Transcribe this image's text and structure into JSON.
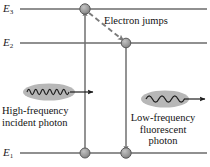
{
  "diagram": {
    "type": "energy-level-diagram",
    "width": 210,
    "height": 167,
    "background_color": "#ffffff",
    "line_color": "#6b6b6b",
    "dot_fill_color": "#9a9a9a",
    "dot_stroke_color": "#4a4a4a",
    "ellipse_fill_color": "#b5b5b5",
    "wave_color": "#2a2a2a",
    "arrow_color": "#6f6f6f",
    "dashed_arrow_color": "#7a7a7a"
  },
  "levels": [
    {
      "id": "E3",
      "label": "E",
      "subscript": "3",
      "y": 9,
      "x_start": 20,
      "x_end": 207
    },
    {
      "id": "E2",
      "label": "E",
      "subscript": "2",
      "y": 43,
      "x_start": 20,
      "x_end": 207
    },
    {
      "id": "E1",
      "label": "E",
      "subscript": "1",
      "y": 153,
      "x_start": 20,
      "x_end": 207
    }
  ],
  "electron_dots": [
    {
      "name": "dot-e3",
      "x": 85,
      "y": 9
    },
    {
      "name": "dot-e2",
      "x": 126,
      "y": 43
    },
    {
      "name": "dot-e1-left",
      "x": 85,
      "y": 153
    },
    {
      "name": "dot-e1-right",
      "x": 126,
      "y": 153
    }
  ],
  "transitions": [
    {
      "name": "absorption-arrow",
      "style": "solid",
      "direction": "up",
      "from": {
        "x": 85,
        "y": 153
      },
      "to": {
        "x": 85,
        "y": 9
      }
    },
    {
      "name": "nonradiative-arrow",
      "style": "dashed",
      "direction": "down-right",
      "from": {
        "x": 89,
        "y": 13
      },
      "to": {
        "x": 124,
        "y": 41
      }
    },
    {
      "name": "emission-arrow",
      "style": "solid",
      "direction": "down",
      "from": {
        "x": 126,
        "y": 43
      },
      "to": {
        "x": 126,
        "y": 153
      }
    }
  ],
  "annotations": {
    "electron_jumps": "Electron jumps"
  },
  "photons": [
    {
      "id": "incident",
      "name": "high-frequency-incident-photon",
      "ellipse": {
        "cx": 49,
        "cy": 92,
        "rx": 26,
        "ry": 8.5
      },
      "wave": {
        "cycles": 6,
        "amplitude": 5,
        "x_start": 27,
        "x_end": 69
      },
      "arrow": {
        "x_start": 70,
        "x_end": 95,
        "y": 92
      },
      "caption_lines": [
        "High-frequency",
        "incident photon"
      ]
    },
    {
      "id": "fluorescent",
      "name": "low-frequency-fluorescent-photon",
      "ellipse": {
        "cx": 165,
        "cy": 99,
        "rx": 24,
        "ry": 8.5
      },
      "wave": {
        "cycles": 3,
        "amplitude": 5.5,
        "x_start": 146,
        "x_end": 184
      },
      "arrow": {
        "x_start": 184,
        "x_end": 206,
        "y": 99
      },
      "caption_lines": [
        "Low-frequency",
        "fluorescent",
        "photon"
      ]
    }
  ]
}
